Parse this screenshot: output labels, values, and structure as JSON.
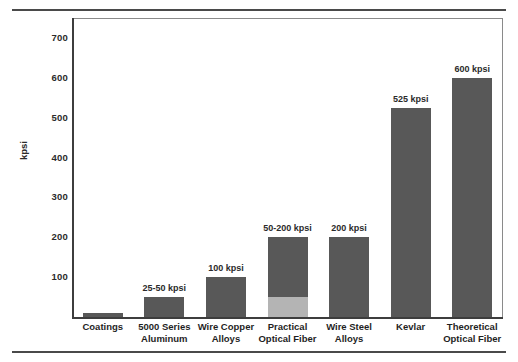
{
  "chart_data": {
    "type": "bar",
    "title": "",
    "subtitle": "",
    "xlabel": "",
    "ylabel": "kpsi",
    "ylim": [
      0,
      750
    ],
    "yticks": [
      100,
      200,
      300,
      400,
      500,
      600,
      700
    ],
    "ytick_labels": [
      "100",
      "200",
      "300",
      "400",
      "500",
      "600",
      "700"
    ],
    "grid": false,
    "legend": "none",
    "categories": [
      "Coatings",
      "5000 Series Aluminum",
      "Wire Copper Alloys",
      "Practical Optical Fiber",
      "Wire Steel Alloys",
      "Kevlar",
      "Theoretical Optical Fiber"
    ],
    "category_lines": [
      [
        "Coatings"
      ],
      [
        "5000 Series",
        "Aluminum"
      ],
      [
        "Wire Copper",
        "Alloys"
      ],
      [
        "Practical",
        "Optical Fiber"
      ],
      [
        "Wire Steel",
        "Alloys"
      ],
      [
        "Kevlar"
      ],
      [
        "Theoretical",
        "Optical Fiber"
      ]
    ],
    "values": [
      10,
      50,
      100,
      200,
      200,
      525,
      600
    ],
    "value_ranges": [
      {
        "low": null,
        "high": 10
      },
      {
        "low": 25,
        "high": 50
      },
      {
        "low": null,
        "high": 100
      },
      {
        "low": 50,
        "high": 200
      },
      {
        "low": null,
        "high": 200
      },
      {
        "low": null,
        "high": 525
      },
      {
        "low": null,
        "high": 600
      }
    ],
    "data_labels": [
      "",
      "25-50 kpsi",
      "100 kpsi",
      "50-200 kpsi",
      "200 kpsi",
      "525 kpsi",
      "600 kpsi"
    ],
    "bar_segments": [
      [
        {
          "from": 0,
          "to": 10,
          "shade": "dark"
        }
      ],
      [
        {
          "from": 0,
          "to": 50,
          "shade": "dark"
        }
      ],
      [
        {
          "from": 0,
          "to": 100,
          "shade": "dark"
        }
      ],
      [
        {
          "from": 0,
          "to": 50,
          "shade": "light"
        },
        {
          "from": 50,
          "to": 200,
          "shade": "dark"
        }
      ],
      [
        {
          "from": 0,
          "to": 200,
          "shade": "dark"
        }
      ],
      [
        {
          "from": 0,
          "to": 525,
          "shade": "dark"
        }
      ],
      [
        {
          "from": 0,
          "to": 600,
          "shade": "dark"
        }
      ]
    ],
    "colors": {
      "bar_dark": "#585858",
      "bar_light": "#b4b4b4",
      "axis": "#3d3d3d",
      "frame": "#8a8a8a",
      "text": "#1f1f1f",
      "rule": "#4a4a4a"
    },
    "units": "kpsi"
  }
}
